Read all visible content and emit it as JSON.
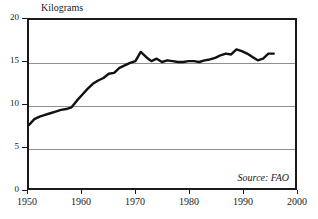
{
  "chart_data": {
    "type": "line",
    "title": "",
    "xlabel": "",
    "ylabel": "Kilograms",
    "ylim": [
      0,
      20
    ],
    "xlim": [
      1950,
      2000
    ],
    "grid": true,
    "legend": null,
    "source_note": "Source: FAO",
    "y_ticks": [
      0,
      5,
      10,
      15,
      20
    ],
    "y_tick_labels": [
      "0",
      "5",
      "10",
      "15",
      "20"
    ],
    "x_ticks": [
      1950,
      1960,
      1970,
      1980,
      1990,
      2000
    ],
    "x_tick_labels": [
      "1950",
      "1960",
      "1970",
      "1980",
      "1990",
      "2000"
    ],
    "series": [
      {
        "name": "Kilograms per person",
        "color": "#111111",
        "x": [
          1950,
          1951,
          1952,
          1953,
          1954,
          1955,
          1956,
          1957,
          1958,
          1959,
          1960,
          1961,
          1962,
          1963,
          1964,
          1965,
          1966,
          1967,
          1968,
          1969,
          1970,
          1971,
          1972,
          1973,
          1974,
          1975,
          1976,
          1977,
          1978,
          1979,
          1980,
          1981,
          1982,
          1983,
          1984,
          1985,
          1986,
          1987,
          1988,
          1989,
          1990,
          1991,
          1992,
          1993,
          1994,
          1995,
          1996
        ],
        "values": [
          7.5,
          8.2,
          8.5,
          8.7,
          8.9,
          9.1,
          9.3,
          9.4,
          9.6,
          10.4,
          11.1,
          11.8,
          12.4,
          12.8,
          13.1,
          13.6,
          13.7,
          14.3,
          14.6,
          14.9,
          15.1,
          16.2,
          15.6,
          15.1,
          15.4,
          15.0,
          15.2,
          15.1,
          15.0,
          15.0,
          15.1,
          15.1,
          15.0,
          15.2,
          15.3,
          15.5,
          15.8,
          16.0,
          15.9,
          16.5,
          16.3,
          16.0,
          15.6,
          15.2,
          15.4,
          16.0,
          16.0
        ]
      }
    ]
  },
  "axes": {
    "y_title": "Kilograms",
    "source": "Source: FAO"
  }
}
